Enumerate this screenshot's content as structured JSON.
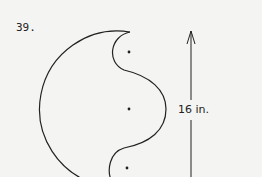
{
  "problem": {
    "number": "39."
  },
  "figure": {
    "dimension_label": "16 in.",
    "shape": "large semicircle with one central semicircular bulge and two quarter-circle notches",
    "centers": 3
  }
}
